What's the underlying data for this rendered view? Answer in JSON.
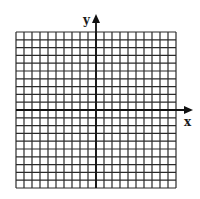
{
  "diagram": {
    "type": "coordinate-grid",
    "grid": {
      "columns": 20,
      "rows": 20,
      "left": 16,
      "top": 32,
      "width": 160,
      "height": 156,
      "line_color": "#2a2a2a"
    },
    "axes": {
      "x_label": "x",
      "y_label": "y",
      "origin": {
        "px": 96,
        "py": 110
      },
      "color": "#111111"
    }
  }
}
